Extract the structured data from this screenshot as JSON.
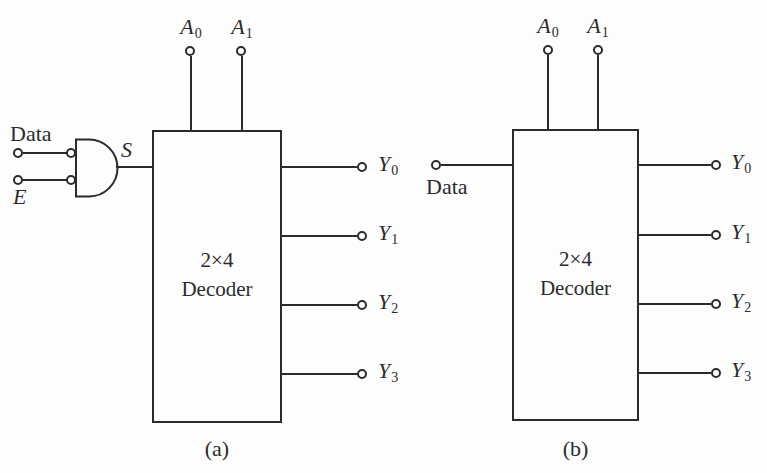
{
  "page": {
    "background_color": "#fdfdfd",
    "ink_color": "#2b2b2b"
  },
  "diagrams": {
    "a": {
      "caption": "(a)",
      "box": {
        "line1": "2×4",
        "line2": "Decoder"
      },
      "top_inputs": [
        {
          "base": "A",
          "sub": "0"
        },
        {
          "base": "A",
          "sub": "1"
        }
      ],
      "left_inputs": {
        "data": "Data",
        "enable": "E"
      },
      "gate": {
        "type": "and-gate",
        "output_label": "S"
      },
      "outputs": [
        {
          "base": "Y",
          "sub": "0"
        },
        {
          "base": "Y",
          "sub": "1"
        },
        {
          "base": "Y",
          "sub": "2"
        },
        {
          "base": "Y",
          "sub": "3"
        }
      ]
    },
    "b": {
      "caption": "(b)",
      "box": {
        "line1": "2×4",
        "line2": "Decoder"
      },
      "top_inputs": [
        {
          "base": "A",
          "sub": "0"
        },
        {
          "base": "A",
          "sub": "1"
        }
      ],
      "left_inputs": {
        "data": "Data"
      },
      "outputs": [
        {
          "base": "Y",
          "sub": "0"
        },
        {
          "base": "Y",
          "sub": "1"
        },
        {
          "base": "Y",
          "sub": "2"
        },
        {
          "base": "Y",
          "sub": "3"
        }
      ]
    }
  }
}
